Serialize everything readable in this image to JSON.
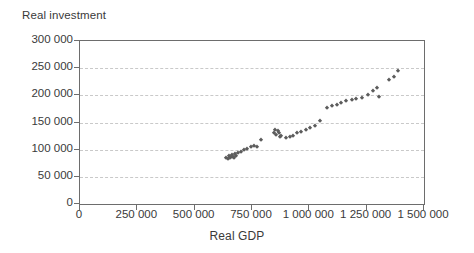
{
  "chart_data": {
    "type": "scatter",
    "title": "",
    "xlabel": "Real GDP",
    "ylabel": "Real investment",
    "xlim": [
      0,
      1500000
    ],
    "ylim": [
      0,
      300000
    ],
    "grid": true,
    "legend": false,
    "marker": "diamond",
    "marker_color": "#5c5c5c",
    "x_ticks": [
      0,
      250000,
      500000,
      750000,
      1000000,
      1250000,
      1500000
    ],
    "y_ticks": [
      0,
      50000,
      100000,
      150000,
      200000,
      250000,
      300000
    ],
    "x_tick_labels": [
      "0",
      "250 000",
      "500 000",
      "750 000",
      "1 000 000",
      "1 250 000",
      "1 500 000"
    ],
    "y_tick_labels": [
      "0",
      "50 000",
      "100 000",
      "150 000",
      "200 000",
      "250 000",
      "300 000"
    ],
    "points": [
      {
        "x": 638000,
        "y": 85000
      },
      {
        "x": 645000,
        "y": 83000
      },
      {
        "x": 650000,
        "y": 88000
      },
      {
        "x": 652000,
        "y": 84000
      },
      {
        "x": 658000,
        "y": 86000
      },
      {
        "x": 662000,
        "y": 90000
      },
      {
        "x": 666000,
        "y": 87000
      },
      {
        "x": 670000,
        "y": 84000
      },
      {
        "x": 675000,
        "y": 92000
      },
      {
        "x": 680000,
        "y": 89000
      },
      {
        "x": 688000,
        "y": 93000
      },
      {
        "x": 700000,
        "y": 95000
      },
      {
        "x": 715000,
        "y": 99000
      },
      {
        "x": 730000,
        "y": 101000
      },
      {
        "x": 745000,
        "y": 104000
      },
      {
        "x": 758000,
        "y": 107000
      },
      {
        "x": 772000,
        "y": 105000
      },
      {
        "x": 790000,
        "y": 117000
      },
      {
        "x": 848000,
        "y": 131000
      },
      {
        "x": 852000,
        "y": 136000
      },
      {
        "x": 856000,
        "y": 127000
      },
      {
        "x": 862000,
        "y": 134000
      },
      {
        "x": 866000,
        "y": 130000
      },
      {
        "x": 870000,
        "y": 124000
      },
      {
        "x": 878000,
        "y": 126000
      },
      {
        "x": 900000,
        "y": 122000
      },
      {
        "x": 915000,
        "y": 124000
      },
      {
        "x": 930000,
        "y": 126000
      },
      {
        "x": 948000,
        "y": 130000
      },
      {
        "x": 965000,
        "y": 132000
      },
      {
        "x": 985000,
        "y": 136000
      },
      {
        "x": 1005000,
        "y": 140000
      },
      {
        "x": 1025000,
        "y": 143000
      },
      {
        "x": 1045000,
        "y": 153000
      },
      {
        "x": 1075000,
        "y": 176000
      },
      {
        "x": 1100000,
        "y": 180000
      },
      {
        "x": 1120000,
        "y": 183000
      },
      {
        "x": 1140000,
        "y": 186000
      },
      {
        "x": 1162000,
        "y": 189000
      },
      {
        "x": 1185000,
        "y": 192000
      },
      {
        "x": 1205000,
        "y": 194000
      },
      {
        "x": 1228000,
        "y": 196000
      },
      {
        "x": 1255000,
        "y": 200000
      },
      {
        "x": 1278000,
        "y": 208000
      },
      {
        "x": 1295000,
        "y": 213000
      },
      {
        "x": 1302000,
        "y": 197000
      },
      {
        "x": 1348000,
        "y": 228000
      },
      {
        "x": 1368000,
        "y": 234000
      },
      {
        "x": 1388000,
        "y": 245000
      }
    ]
  }
}
